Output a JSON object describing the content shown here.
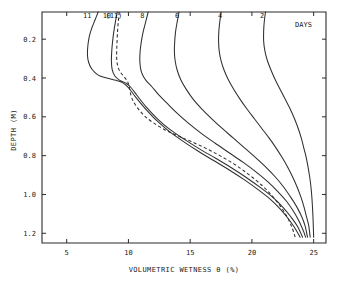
{
  "chart_data": {
    "type": "line",
    "title": "",
    "xlabel": "VOLUMETRIC WETNESS  θ (%)",
    "ylabel": "DEPTH (M)",
    "xlim": [
      3,
      26
    ],
    "ylim": [
      1.25,
      0.06
    ],
    "y_inverted": true,
    "grid": false,
    "legend": "inline-curve-labels",
    "legend_note": "DAYS",
    "xticks": [
      5,
      10,
      15,
      20,
      25
    ],
    "xticklabels": [
      "5",
      "10",
      "15",
      "20",
      "25"
    ],
    "yticks": [
      0.2,
      0.4,
      0.6,
      0.8,
      1.0,
      1.2
    ],
    "yticklabels": [
      "0.2",
      "0.4",
      "0.6",
      "0.8",
      "1.0",
      "1.2"
    ],
    "series": [
      {
        "name": "11",
        "label": "11",
        "style": "solid",
        "label_x": 7.0,
        "label_y": 0.09,
        "points": [
          [
            7.55,
            0.06
          ],
          [
            7.3,
            0.1
          ],
          [
            7.05,
            0.14
          ],
          [
            6.85,
            0.18
          ],
          [
            6.72,
            0.23
          ],
          [
            6.68,
            0.28
          ],
          [
            6.78,
            0.32
          ],
          [
            7.05,
            0.355
          ],
          [
            7.55,
            0.385
          ],
          [
            8.25,
            0.4
          ],
          [
            9.0,
            0.412
          ],
          [
            9.55,
            0.425
          ],
          [
            10.0,
            0.45
          ],
          [
            10.6,
            0.5
          ],
          [
            11.4,
            0.56
          ],
          [
            12.3,
            0.62
          ],
          [
            13.3,
            0.675
          ],
          [
            14.4,
            0.725
          ],
          [
            15.6,
            0.775
          ],
          [
            16.9,
            0.825
          ],
          [
            18.2,
            0.875
          ],
          [
            19.4,
            0.925
          ],
          [
            20.5,
            0.975
          ],
          [
            21.5,
            1.025
          ],
          [
            22.3,
            1.075
          ],
          [
            22.95,
            1.125
          ],
          [
            23.5,
            1.175
          ],
          [
            23.9,
            1.22
          ]
        ]
      },
      {
        "name": "10",
        "label": "10",
        "style": "solid",
        "label_x": 8.6,
        "label_y": 0.09,
        "points": [
          [
            9.1,
            0.06
          ],
          [
            8.95,
            0.11
          ],
          [
            8.82,
            0.16
          ],
          [
            8.72,
            0.21
          ],
          [
            8.65,
            0.26
          ],
          [
            8.62,
            0.31
          ],
          [
            8.68,
            0.355
          ],
          [
            8.9,
            0.39
          ],
          [
            9.3,
            0.412
          ],
          [
            9.75,
            0.425
          ],
          [
            10.15,
            0.445
          ],
          [
            10.7,
            0.49
          ],
          [
            11.45,
            0.55
          ],
          [
            12.35,
            0.61
          ],
          [
            13.35,
            0.665
          ],
          [
            14.5,
            0.715
          ],
          [
            15.75,
            0.765
          ],
          [
            17.1,
            0.815
          ],
          [
            18.4,
            0.865
          ],
          [
            19.6,
            0.915
          ],
          [
            20.7,
            0.965
          ],
          [
            21.7,
            1.015
          ],
          [
            22.5,
            1.065
          ],
          [
            23.15,
            1.115
          ],
          [
            23.7,
            1.165
          ],
          [
            24.1,
            1.22
          ]
        ]
      },
      {
        "name": "(11)",
        "label": "(11)",
        "style": "dashed",
        "label_x": 9.5,
        "label_y": 0.09,
        "points": [
          [
            9.25,
            0.06
          ],
          [
            9.18,
            0.11
          ],
          [
            9.12,
            0.16
          ],
          [
            9.08,
            0.21
          ],
          [
            9.05,
            0.26
          ],
          [
            9.05,
            0.3
          ],
          [
            9.12,
            0.335
          ],
          [
            9.3,
            0.365
          ],
          [
            9.6,
            0.39
          ],
          [
            9.9,
            0.415
          ],
          [
            10.05,
            0.44
          ],
          [
            10.15,
            0.475
          ],
          [
            10.35,
            0.515
          ],
          [
            10.75,
            0.555
          ],
          [
            11.3,
            0.595
          ],
          [
            12.0,
            0.63
          ],
          [
            12.9,
            0.665
          ],
          [
            13.9,
            0.695
          ],
          [
            15.0,
            0.725
          ],
          [
            16.2,
            0.76
          ],
          [
            17.4,
            0.8
          ],
          [
            18.6,
            0.845
          ],
          [
            19.7,
            0.895
          ],
          [
            20.75,
            0.95
          ],
          [
            21.6,
            1.005
          ],
          [
            22.3,
            1.06
          ],
          [
            22.85,
            1.115
          ],
          [
            23.25,
            1.17
          ],
          [
            23.5,
            1.22
          ]
        ]
      },
      {
        "name": "8",
        "label": "8",
        "style": "solid",
        "label_x": 11.3,
        "label_y": 0.09,
        "points": [
          [
            11.6,
            0.06
          ],
          [
            11.4,
            0.11
          ],
          [
            11.2,
            0.16
          ],
          [
            11.05,
            0.21
          ],
          [
            10.95,
            0.26
          ],
          [
            10.92,
            0.305
          ],
          [
            10.98,
            0.35
          ],
          [
            11.15,
            0.385
          ],
          [
            11.45,
            0.415
          ],
          [
            11.9,
            0.445
          ],
          [
            12.5,
            0.49
          ],
          [
            13.2,
            0.535
          ],
          [
            14.0,
            0.585
          ],
          [
            14.9,
            0.635
          ],
          [
            15.9,
            0.685
          ],
          [
            17.0,
            0.735
          ],
          [
            18.15,
            0.785
          ],
          [
            19.3,
            0.835
          ],
          [
            20.35,
            0.885
          ],
          [
            21.3,
            0.935
          ],
          [
            22.1,
            0.985
          ],
          [
            22.8,
            1.035
          ],
          [
            23.35,
            1.085
          ],
          [
            23.8,
            1.135
          ],
          [
            24.15,
            1.185
          ],
          [
            24.35,
            1.22
          ]
        ]
      },
      {
        "name": "6",
        "label": "6",
        "style": "solid",
        "label_x": 14.1,
        "label_y": 0.09,
        "points": [
          [
            14.1,
            0.06
          ],
          [
            13.95,
            0.11
          ],
          [
            13.82,
            0.16
          ],
          [
            13.75,
            0.21
          ],
          [
            13.72,
            0.26
          ],
          [
            13.78,
            0.31
          ],
          [
            13.95,
            0.36
          ],
          [
            14.25,
            0.41
          ],
          [
            14.7,
            0.46
          ],
          [
            15.25,
            0.51
          ],
          [
            15.95,
            0.56
          ],
          [
            16.75,
            0.61
          ],
          [
            17.6,
            0.66
          ],
          [
            18.5,
            0.71
          ],
          [
            19.4,
            0.76
          ],
          [
            20.3,
            0.81
          ],
          [
            21.15,
            0.86
          ],
          [
            21.9,
            0.91
          ],
          [
            22.55,
            0.96
          ],
          [
            23.1,
            1.01
          ],
          [
            23.6,
            1.06
          ],
          [
            24.0,
            1.11
          ],
          [
            24.3,
            1.16
          ],
          [
            24.5,
            1.22
          ]
        ]
      },
      {
        "name": "4",
        "label": "4",
        "style": "solid",
        "label_x": 17.6,
        "label_y": 0.09,
        "points": [
          [
            17.5,
            0.06
          ],
          [
            17.4,
            0.11
          ],
          [
            17.32,
            0.16
          ],
          [
            17.3,
            0.21
          ],
          [
            17.35,
            0.26
          ],
          [
            17.5,
            0.31
          ],
          [
            17.75,
            0.36
          ],
          [
            18.1,
            0.41
          ],
          [
            18.55,
            0.46
          ],
          [
            19.05,
            0.51
          ],
          [
            19.6,
            0.56
          ],
          [
            20.2,
            0.61
          ],
          [
            20.8,
            0.66
          ],
          [
            21.4,
            0.71
          ],
          [
            21.95,
            0.76
          ],
          [
            22.45,
            0.81
          ],
          [
            22.9,
            0.86
          ],
          [
            23.3,
            0.91
          ],
          [
            23.65,
            0.96
          ],
          [
            23.95,
            1.01
          ],
          [
            24.2,
            1.06
          ],
          [
            24.4,
            1.11
          ],
          [
            24.6,
            1.16
          ],
          [
            24.72,
            1.22
          ]
        ]
      },
      {
        "name": "2",
        "label": "2",
        "style": "solid",
        "label_x": 21.0,
        "label_y": 0.09,
        "points": [
          [
            21.1,
            0.06
          ],
          [
            21.0,
            0.11
          ],
          [
            20.95,
            0.16
          ],
          [
            20.95,
            0.21
          ],
          [
            21.05,
            0.26
          ],
          [
            21.25,
            0.31
          ],
          [
            21.55,
            0.36
          ],
          [
            21.9,
            0.41
          ],
          [
            22.3,
            0.46
          ],
          [
            22.7,
            0.51
          ],
          [
            23.1,
            0.56
          ],
          [
            23.45,
            0.61
          ],
          [
            23.75,
            0.66
          ],
          [
            24.0,
            0.71
          ],
          [
            24.2,
            0.76
          ],
          [
            24.4,
            0.81
          ],
          [
            24.55,
            0.86
          ],
          [
            24.68,
            0.91
          ],
          [
            24.78,
            0.96
          ],
          [
            24.85,
            1.01
          ],
          [
            24.9,
            1.06
          ],
          [
            24.94,
            1.11
          ],
          [
            24.97,
            1.16
          ],
          [
            25.0,
            1.22
          ]
        ]
      }
    ]
  },
  "labels": {
    "days_note": "DAYS",
    "xaxis_title": "VOLUMETRIC WETNESS  θ (%)",
    "yaxis_title": "DEPTH (M)"
  },
  "colors": {
    "line": "#2f2f2f",
    "frame": "#2b2b2b",
    "text": "#1a1a1a",
    "background": "#ffffff"
  }
}
